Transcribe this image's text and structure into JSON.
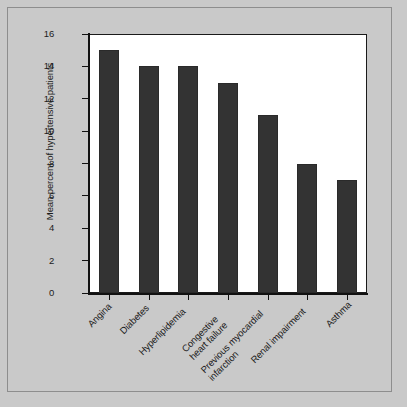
{
  "figure": {
    "background_color": "#c9c9c9",
    "plot_background_color": "#ffffff",
    "bar_color": "#333333",
    "axis_color": "#111111"
  },
  "chart_data": {
    "type": "bar",
    "title": "",
    "subtitle": "",
    "xlabel": "",
    "ylabel": "Mean percent of hypertensive patients",
    "categories": [
      "Angina",
      "Diabetes",
      "Hyperlipidemia",
      "Congestive\nheart failure",
      "Previous myocardial\ninfarction",
      "Renal impairment",
      "Asthma"
    ],
    "values": [
      15,
      14,
      14,
      13,
      11,
      8,
      7
    ],
    "ylim": [
      0,
      16
    ],
    "ytick_values": [
      0,
      2,
      4,
      6,
      8,
      10,
      12,
      14,
      16
    ],
    "ytick_labels": [
      "0",
      "2",
      "4",
      "6",
      "8",
      "10",
      "12",
      "14",
      "16"
    ],
    "grid": false,
    "legend": false,
    "legend_position": "none",
    "x_tick_label_rotation": -45,
    "series": [
      {
        "name": "Mean percent of hypertensive patients",
        "values": [
          15,
          14,
          14,
          13,
          11,
          8,
          7
        ]
      }
    ]
  }
}
